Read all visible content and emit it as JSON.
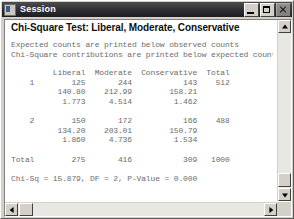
{
  "window": {
    "title": "Session",
    "icon": "session-app-icon",
    "controls": {
      "minimize": "Minimize",
      "maximize": "Maximize",
      "close": "Close"
    }
  },
  "output": {
    "title": "Chi-Square Test: Liberal, Moderate, Conservative",
    "notes": [
      "Expected counts are printed below observed counts",
      "Chi-Square contributions are printed below expected counts"
    ],
    "table": {
      "header": "         Liberal  Moderate  Conservative  Total",
      "rows": [
        "    1        125       244           143    512",
        "          140.80    212.99        158.21",
        "           1.773     4.514         1.462",
        "",
        "    2        150       172           166    488",
        "          134.20    203.01        150.79",
        "           1.860     4.736         1.534",
        "",
        "Total        275       416           309   1000"
      ]
    },
    "summary": "Chi-Sq = 15.879, DF = 2, P-Value = 0.000"
  },
  "chart_data": {
    "type": "table",
    "title": "Chi-Square Test: Liberal, Moderate, Conservative",
    "categories": [
      "Liberal",
      "Moderate",
      "Conservative"
    ],
    "row_labels": [
      "1",
      "2",
      "Total"
    ],
    "observed": [
      [
        125,
        244,
        143
      ],
      [
        150,
        172,
        166
      ]
    ],
    "expected": [
      [
        140.8,
        212.99,
        158.21
      ],
      [
        134.2,
        203.01,
        150.79
      ]
    ],
    "contributions": [
      [
        1.773,
        4.514,
        1.462
      ],
      [
        1.86,
        4.736,
        1.534
      ]
    ],
    "row_totals": [
      512,
      488
    ],
    "column_totals": [
      275,
      416,
      309
    ],
    "grand_total": 1000,
    "chi_sq": 15.879,
    "df": 2,
    "p_value": 0.0
  },
  "scrollbars": {
    "vertical": {
      "up": "Scroll up",
      "down": "Scroll down",
      "thumb": "Vertical scroll thumb"
    },
    "horizontal": {
      "left": "Scroll left",
      "right": "Scroll right",
      "thumb": "Horizontal scroll thumb"
    }
  }
}
